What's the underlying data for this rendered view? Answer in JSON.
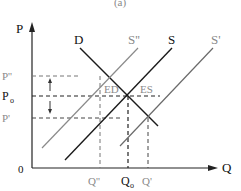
{
  "diagram": {
    "caption": "(a)",
    "axes": {
      "y_label": "P",
      "x_label": "Q",
      "origin": "0"
    },
    "curves": [
      {
        "id": "D",
        "label": "D",
        "color": "#1a1a1a"
      },
      {
        "id": "S2",
        "label": "S''",
        "color": "#8a8a8a"
      },
      {
        "id": "S",
        "label": "S",
        "color": "#1a1a1a"
      },
      {
        "id": "S1",
        "label": "S'",
        "color": "#6a6a6a"
      }
    ],
    "price_labels": {
      "p_high": "P''",
      "p_eq": "P",
      "p_eq_sub": "o",
      "p_low": "P'"
    },
    "quantity_labels": {
      "q_high": "Q''",
      "q_eq": "Q",
      "q_eq_sub": "o",
      "q_low": "Q'"
    },
    "segment_labels": {
      "excess_demand": "ED",
      "excess_supply": "ES"
    }
  }
}
